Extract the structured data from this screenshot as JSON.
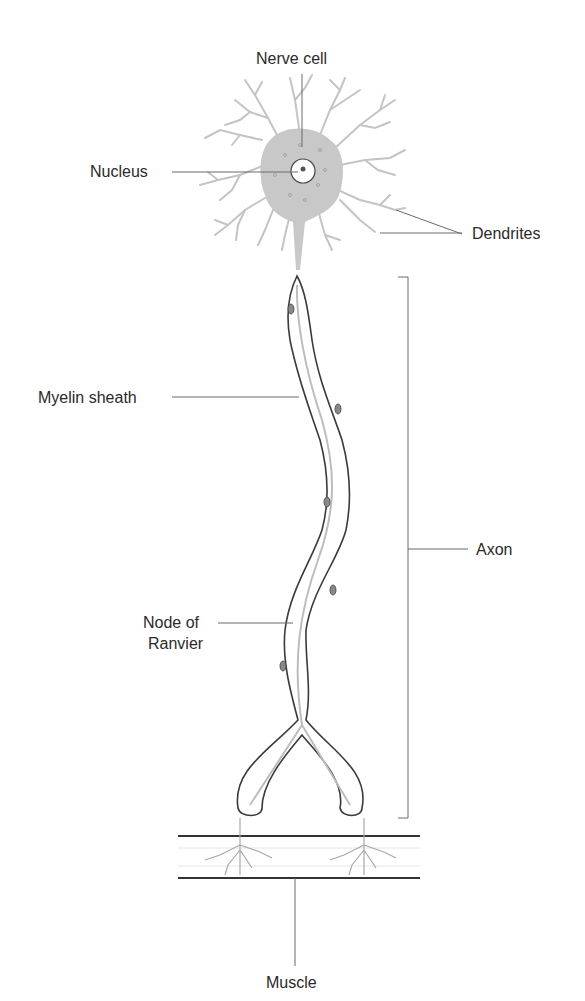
{
  "diagram": {
    "labels": {
      "nerve_cell": "Nerve cell",
      "nucleus": "Nucleus",
      "dendrites": "Dendrites",
      "myelin_sheath": "Myelin sheath",
      "axon": "Axon",
      "node_of_ranvier_line1": "Node of",
      "node_of_ranvier_line2": "Ranvier",
      "muscle": "Muscle"
    },
    "colors": {
      "text": "#2a2a2a",
      "leader_line": "#6a6a6a",
      "cell_body_fill": "#c8c8c8",
      "axon_outline": "#3a3a3a",
      "axon_core": "#bdbdbd",
      "muscle_line": "#333333",
      "background": "#ffffff"
    }
  }
}
